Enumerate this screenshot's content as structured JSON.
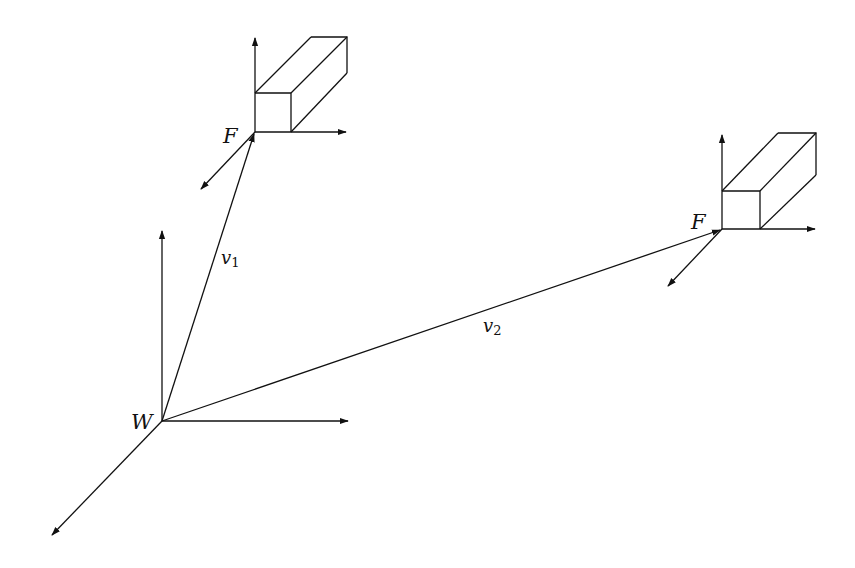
{
  "diagram": {
    "colors": {
      "stroke": "#111111",
      "background": "#ffffff"
    },
    "world_frame": {
      "label": "W",
      "origin": [
        162,
        421
      ],
      "axes": {
        "up": [
          162,
          230
        ],
        "right": [
          348,
          421
        ],
        "depth": [
          51,
          536
        ]
      }
    },
    "frames": [
      {
        "label": "F",
        "origin": [
          255,
          132
        ],
        "axes": {
          "up": [
            255,
            37
          ],
          "right": [
            346,
            132
          ],
          "depth": [
            200,
            190
          ]
        },
        "box": {
          "front": [
            [
              255,
              93
            ],
            [
              291,
              93
            ],
            [
              291,
              132
            ],
            [
              255,
              132
            ]
          ],
          "back_top_left": [
            311,
            37
          ],
          "back_top_right": [
            347,
            37
          ],
          "back_bottom_right": [
            347,
            73
          ]
        }
      },
      {
        "label": "F",
        "origin": [
          722,
          229
        ],
        "axes": {
          "up": [
            722,
            134
          ],
          "right": [
            815,
            229
          ],
          "depth": [
            667,
            287
          ]
        },
        "box": {
          "front": [
            [
              722,
              191
            ],
            [
              760,
              191
            ],
            [
              760,
              229
            ],
            [
              722,
              229
            ]
          ],
          "back_top_left": [
            778,
            133
          ],
          "back_top_right": [
            816,
            133
          ],
          "back_bottom_right": [
            816,
            175
          ]
        }
      }
    ],
    "vectors": [
      {
        "label": "v",
        "subscript": "1",
        "from": "W",
        "to": "F (top)"
      },
      {
        "label": "v",
        "subscript": "2",
        "from": "W",
        "to": "F (right)"
      }
    ]
  }
}
